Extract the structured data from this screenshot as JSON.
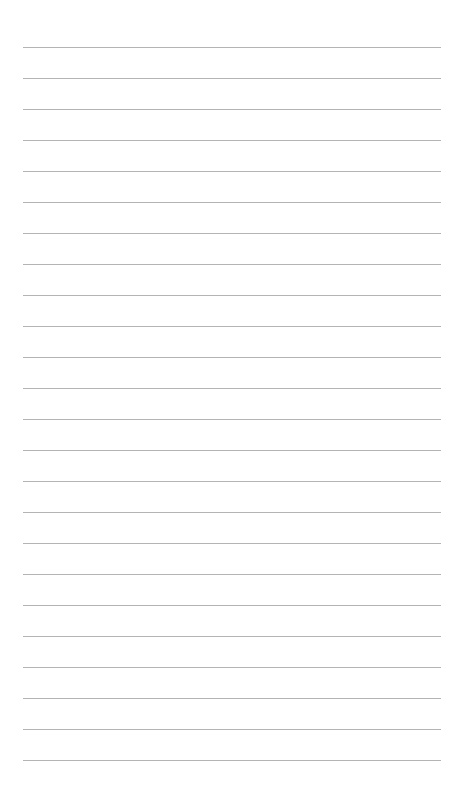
{
  "page": {
    "type": "lined-paper",
    "background": "#ffffff",
    "line_color": "#b4b4b4",
    "line_count": 24,
    "first_line_y": 47,
    "line_spacing": 31,
    "line_left": 23,
    "line_width": 418
  }
}
